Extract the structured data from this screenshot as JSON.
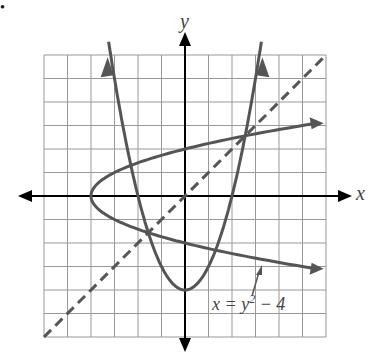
{
  "chart_data": {
    "type": "line",
    "title": "",
    "xlabel": "x",
    "ylabel": "y",
    "xlim": [
      -6,
      6
    ],
    "ylim": [
      -6,
      6
    ],
    "grid": true,
    "series": [
      {
        "name": "y = x^2 - 4",
        "kind": "parabola (solid)",
        "points": [
          [
            -3,
            5
          ],
          [
            -2,
            0
          ],
          [
            -1,
            -3
          ],
          [
            0,
            -4
          ],
          [
            1,
            -3
          ],
          [
            2,
            0
          ],
          [
            3,
            5
          ]
        ]
      },
      {
        "name": "x = y^2 - 4",
        "kind": "sideways parabola (solid)",
        "points": [
          [
            -4,
            0
          ],
          [
            -3,
            1
          ],
          [
            0,
            2
          ],
          [
            5,
            3
          ],
          [
            -3,
            -1
          ],
          [
            0,
            -2
          ],
          [
            5,
            -3
          ]
        ]
      },
      {
        "name": "y = x",
        "kind": "dashed line",
        "points": [
          [
            -6,
            -6
          ],
          [
            6,
            6
          ]
        ]
      }
    ],
    "annotations": [
      {
        "text": "x = y² − 4",
        "points_to": "lower branch of sideways parabola"
      }
    ]
  },
  "labels": {
    "x_axis": "x",
    "y_axis": "y",
    "equation_main": "x = y",
    "equation_sup": "2",
    "equation_tail": " − 4",
    "bullet": "•"
  }
}
